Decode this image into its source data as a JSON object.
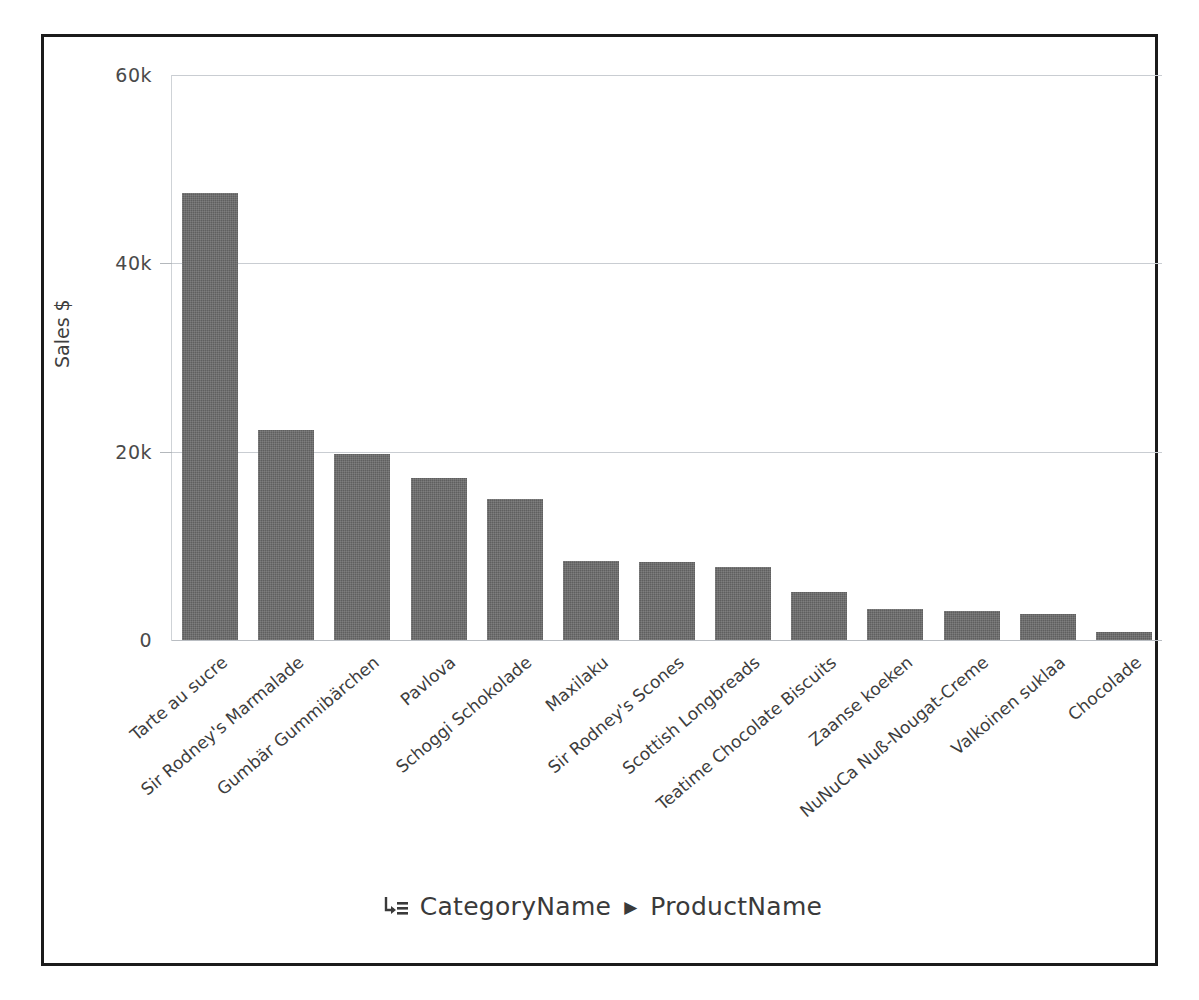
{
  "chart_data": {
    "type": "bar",
    "title": "",
    "subtitle": "",
    "xlabel": "",
    "ylabel": "Sales $",
    "ylim": [
      0,
      60000
    ],
    "yticks": [
      0,
      20000,
      40000,
      60000
    ],
    "ytick_labels": [
      "0",
      "20k",
      "40k",
      "60k"
    ],
    "grid": true,
    "legend": "none",
    "orientation": "vertical",
    "bar_color": "#5f5f5f",
    "categories": [
      "Tarte au sucre",
      "Sir Rodney's Marmalade",
      "Gumbär Gummibärchen",
      "Pavlova",
      "Schoggi Schokolade",
      "Maxilaku",
      "Sir Rodney's Scones",
      "Scottish Longbreads",
      "Teatime Chocolate Biscuits",
      "Zaanse koeken",
      "NuNuCa Nuß-Nougat-Creme",
      "Valkoinen suklaa",
      "Chocolade"
    ],
    "values": [
      47500,
      22300,
      19800,
      17200,
      15000,
      8400,
      8300,
      7800,
      5100,
      3300,
      3100,
      2800,
      900
    ]
  },
  "axis": {
    "y_title": "Sales $",
    "y_tick_labels": [
      "60k",
      "40k",
      "20k",
      "0"
    ]
  },
  "footer": {
    "icon": "drill-down-icon",
    "level_1": "CategoryName",
    "separator": "▶",
    "level_2": "ProductName"
  }
}
